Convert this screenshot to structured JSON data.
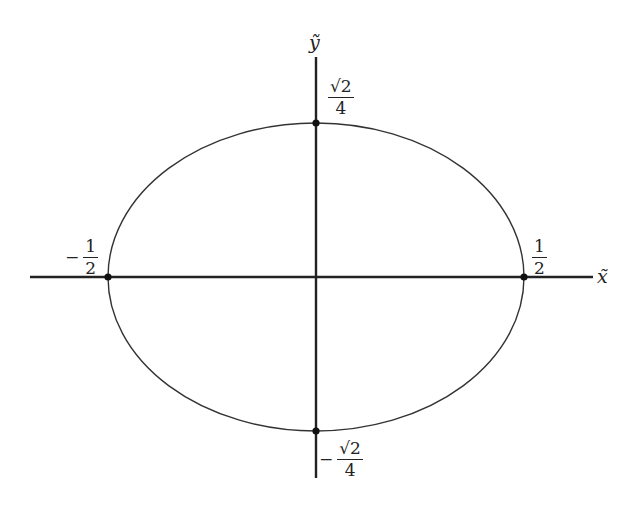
{
  "diagram": {
    "type": "ellipse-on-axes",
    "colors": {
      "curve": "#333333",
      "axis": "#222222",
      "point": "#111111",
      "background": "#ffffff"
    },
    "axes": {
      "x_label": "x̃",
      "y_label": "ỹ"
    },
    "points": [
      {
        "id": "top",
        "sign": "",
        "numerator": "√2",
        "denominator": "4"
      },
      {
        "id": "bottom",
        "sign": "−",
        "numerator": "√2",
        "denominator": "4"
      },
      {
        "id": "left",
        "sign": "−",
        "numerator": "1",
        "denominator": "2"
      },
      {
        "id": "right",
        "sign": "",
        "numerator": "1",
        "denominator": "2"
      }
    ]
  }
}
